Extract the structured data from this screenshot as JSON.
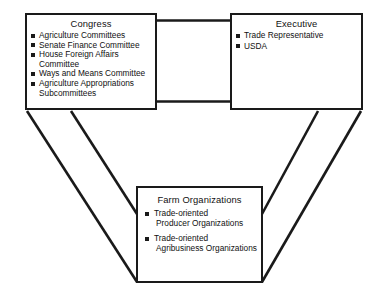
{
  "diagram": {
    "type": "policy-subsystem-triangle",
    "line_color": "#1a1a1a",
    "background_color": "#ffffff",
    "nodes": [
      {
        "id": "congress",
        "title": "Congress",
        "items": [
          {
            "lines": [
              "Agriculture Committees"
            ]
          },
          {
            "lines": [
              "Senate Finance Committee"
            ]
          },
          {
            "lines": [
              "House Foreign Affairs",
              "Committee"
            ]
          },
          {
            "lines": [
              "Ways and Means Committee"
            ]
          },
          {
            "lines": [
              "Agriculture Appropriations",
              "Subcommittees"
            ]
          }
        ]
      },
      {
        "id": "executive",
        "title": "Executive",
        "items": [
          {
            "lines": [
              "Trade Representative"
            ]
          },
          {
            "lines": [
              "USDA"
            ]
          }
        ]
      },
      {
        "id": "farm",
        "title": "Farm Organizations",
        "items": [
          {
            "lines": [
              "Trade-oriented",
              "Producer Organizations"
            ]
          },
          {
            "lines": [
              "Trade-oriented",
              "Agribusiness Organizations"
            ]
          }
        ]
      }
    ],
    "connectors": [
      {
        "id": "congress-executive",
        "from": "congress",
        "to": "executive",
        "style": "double-line-horizontal-band"
      },
      {
        "id": "congress-farm",
        "from": "congress",
        "to": "farm",
        "style": "double-line-diagonal-band"
      },
      {
        "id": "executive-farm",
        "from": "executive",
        "to": "farm",
        "style": "double-line-diagonal-band"
      }
    ]
  }
}
